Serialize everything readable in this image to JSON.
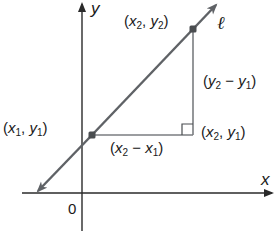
{
  "diagram": {
    "axes": {
      "x_label": "x",
      "y_label": "y",
      "origin_label": "0"
    },
    "line": {
      "label": "ℓ",
      "color": "#5f6266"
    },
    "points": {
      "p1": {
        "label": "(x₁, y₁)",
        "x_sym": "x",
        "x_sub": "1",
        "y_sym": "y",
        "y_sub": "1"
      },
      "p2": {
        "label": "(x₂, y₂)",
        "x_sym": "x",
        "x_sub": "2",
        "y_sym": "y",
        "y_sub": "2"
      },
      "corner": {
        "label": "(x₂, y₁)",
        "x_sym": "x",
        "x_sub": "2",
        "y_sym": "y",
        "y_sub": "1"
      }
    },
    "legs": {
      "rise": {
        "label": "(y₂ − y₁)",
        "a_sym": "y",
        "a_sub": "2",
        "op": "−",
        "b_sym": "y",
        "b_sub": "1"
      },
      "run": {
        "label": "(x₂ − x₁)",
        "a_sym": "x",
        "a_sub": "2",
        "op": "−",
        "b_sym": "x",
        "b_sub": "1"
      }
    },
    "colors": {
      "axis": "#2a2a2a",
      "line": "#5f6266",
      "triangle": "#7a7d80",
      "point": "#4a4d50",
      "text": "#1a1a1a"
    },
    "punct": {
      "open": "(",
      "comma": ", ",
      "close": ")",
      "space": " "
    }
  }
}
